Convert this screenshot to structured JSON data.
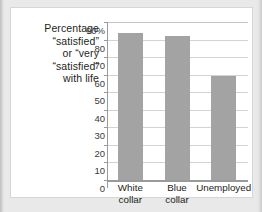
{
  "caption": {
    "lines": [
      "Percentage",
      "“satisfied”",
      "or “very",
      "“satisfied”",
      "with life"
    ]
  },
  "colors": {
    "bar": "#a3a3a3",
    "gridline": "#d3d3d3",
    "axis": "#9a9a9a",
    "card_background": "#ffffff",
    "page_background": "#e9e9ea",
    "text": "#231f20"
  },
  "chart_data": {
    "type": "bar",
    "title": "",
    "xlabel": "",
    "ylabel": "Percentage “satisfied” or “very satisfied” with life",
    "categories": [
      "White collar",
      "Blue collar",
      "Unemployed"
    ],
    "category_lines": [
      [
        "White",
        "collar"
      ],
      [
        "Blue",
        "collar"
      ],
      [
        "Unemployed"
      ]
    ],
    "values": [
      84,
      82,
      59
    ],
    "ylim": [
      0,
      90
    ],
    "ytick_values": [
      0,
      10,
      20,
      30,
      40,
      50,
      60,
      70,
      80,
      90
    ],
    "ytick_labels": [
      "0",
      "10",
      "20",
      "30",
      "40",
      "50",
      "60",
      "70",
      "80",
      "90%"
    ],
    "grid": true,
    "legend": "none"
  }
}
